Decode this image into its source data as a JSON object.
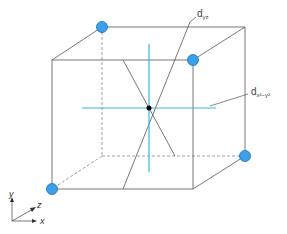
{
  "diagram": {
    "type": "cubic crystal field orbital diagram",
    "labels": {
      "dyz": {
        "main": "d",
        "sub": "yz"
      },
      "dx2y2": {
        "main": "d",
        "sub": "x²−y²"
      }
    },
    "axes": {
      "y": "y",
      "z": "z",
      "x": "x"
    },
    "colors": {
      "atom_fill": "#3aa0ea",
      "orbital_blue": "#38b6e0",
      "edges": "#555555",
      "center": "#000000"
    },
    "atoms_count": 4
  }
}
